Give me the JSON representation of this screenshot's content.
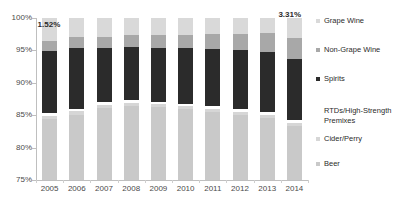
{
  "chart_data": {
    "type": "bar",
    "title": "",
    "subtitle": "",
    "xlabel": "",
    "ylabel": "",
    "stacked": true,
    "stack_mode": "percent",
    "grid": false,
    "legend_position": "right",
    "ylim": [
      75,
      100
    ],
    "ytick_labels": [
      "100%",
      "95%",
      "90%",
      "85%",
      "80%",
      "75%"
    ],
    "ytick_values": [
      100,
      95,
      90,
      85,
      80,
      75
    ],
    "categories": [
      "2005",
      "2006",
      "2007",
      "2008",
      "2009",
      "2010",
      "2011",
      "2012",
      "2013",
      "2014"
    ],
    "series": [
      {
        "name": "Beer",
        "color": "#c9c9c9",
        "values": [
          84.4,
          85.1,
          86.1,
          86.4,
          86.2,
          85.9,
          85.5,
          85.0,
          84.6,
          83.3
        ]
      },
      {
        "name": "Cider/Perry",
        "color": "#d6d6d6",
        "values": [
          0.5,
          0.5,
          0.5,
          0.5,
          0.5,
          0.5,
          0.5,
          0.5,
          0.5,
          0.5
        ]
      },
      {
        "name": "RTDs/High-Strength Premixes",
        "color": "#ffffff",
        "values": [
          0.4,
          0.4,
          0.4,
          0.4,
          0.4,
          0.4,
          0.4,
          0.4,
          0.4,
          0.4
        ]
      },
      {
        "name": "Spirits",
        "color": "#2b2b2b",
        "values": [
          9.6,
          9.4,
          8.4,
          8.2,
          8.3,
          8.5,
          8.8,
          9.1,
          9.3,
          9.4
        ]
      },
      {
        "name": "Non-Grape Wine",
        "color": "#a8a8a8",
        "values": [
          1.52,
          1.6,
          1.7,
          1.8,
          1.9,
          2.1,
          2.3,
          2.6,
          2.9,
          3.31
        ]
      },
      {
        "name": "Grape Wine",
        "color": "#d9d9d9",
        "values": [
          3.58,
          3.0,
          2.9,
          2.7,
          2.7,
          2.6,
          2.5,
          2.4,
          2.3,
          3.09
        ]
      }
    ],
    "annotations": [
      {
        "text": "1.52%",
        "category": "2005",
        "series": "Non-Grape Wine"
      },
      {
        "text": "3.31%",
        "category": "2014",
        "series": "Non-Grape Wine"
      }
    ]
  },
  "legend": {
    "items": [
      {
        "label": "Grape Wine"
      },
      {
        "label": "Non-Grape Wine"
      },
      {
        "label": "Spirits"
      },
      {
        "label": "RTDs/High-Strength Premixes"
      },
      {
        "label": "Cider/Perry"
      },
      {
        "label": "Beer"
      }
    ]
  }
}
